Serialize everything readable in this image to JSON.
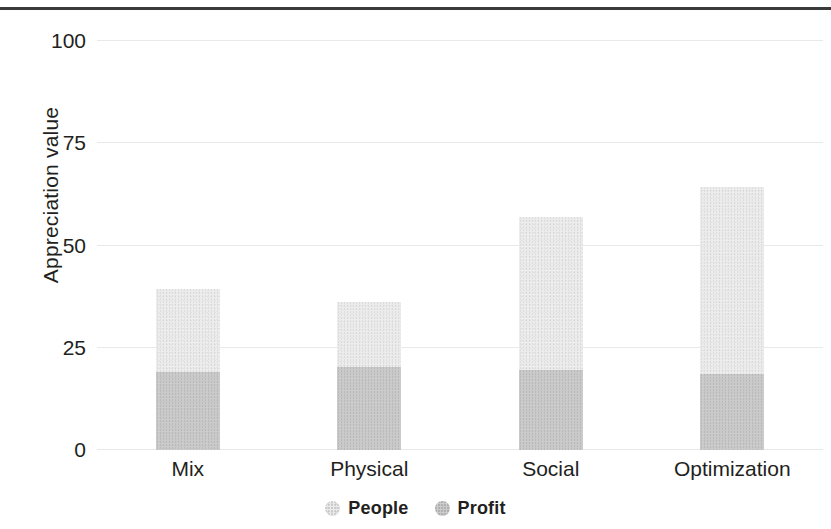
{
  "chart_data": {
    "type": "bar",
    "subtype": "stacked",
    "title": "",
    "xlabel": "",
    "ylabel": "Appreciation value",
    "categories": [
      "Mix",
      "Physical",
      "Social",
      "Optimization"
    ],
    "series": [
      {
        "name": "Profit",
        "color": "#c9c9c9",
        "values": [
          19,
          20.3,
          19.5,
          18.6
        ]
      },
      {
        "name": "People",
        "color": "#ececec",
        "values": [
          20.4,
          15.8,
          37.5,
          45.8
        ]
      }
    ],
    "stack_totals": [
      39.4,
      36.1,
      57.0,
      64.4
    ],
    "ylim": [
      0,
      100
    ],
    "yticks": [
      0,
      25,
      50,
      75,
      100
    ],
    "ytick_labels": [
      "0",
      "25",
      "50",
      "75",
      "100"
    ],
    "grid": true,
    "grid_axis": "y",
    "grid_color": "#e9e9ea",
    "legend": {
      "position": "bottom",
      "entries": [
        {
          "label": "People",
          "swatch": "people-swatch-icon",
          "color": "#ececec"
        },
        {
          "label": "Profit",
          "swatch": "profit-swatch-icon",
          "color": "#c9c9c9"
        }
      ]
    },
    "background_color": "#ffffff",
    "top_rule_color": "#3a3a3c"
  }
}
